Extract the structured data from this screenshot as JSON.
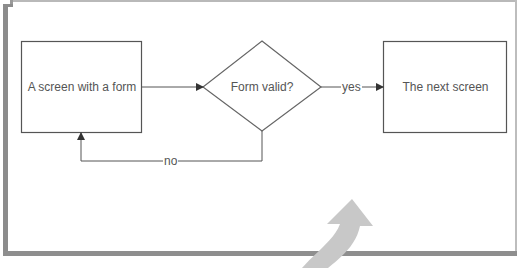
{
  "diagram": {
    "type": "flowchart",
    "nodes": [
      {
        "id": "screen-with-form",
        "shape": "rectangle",
        "label": "A screen with a form"
      },
      {
        "id": "form-valid",
        "shape": "diamond",
        "label": "Form valid?"
      },
      {
        "id": "next-screen",
        "shape": "rectangle",
        "label": "The next screen"
      }
    ],
    "edges": [
      {
        "from": "screen-with-form",
        "to": "form-valid",
        "label": ""
      },
      {
        "from": "form-valid",
        "to": "next-screen",
        "label": "yes"
      },
      {
        "from": "form-valid",
        "to": "screen-with-form",
        "label": "no"
      }
    ],
    "decorations": [
      {
        "type": "curved-arrow",
        "direction": "up",
        "color": "#c8c8c8"
      }
    ],
    "colors": {
      "stroke": "#555555",
      "text": "#555555",
      "frame": "#8c8c8c",
      "curved_arrow": "#c8c8c8"
    }
  }
}
